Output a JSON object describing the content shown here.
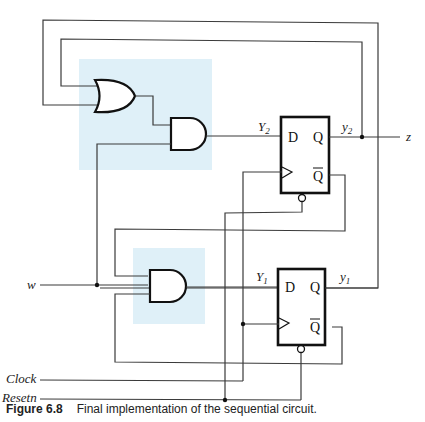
{
  "figure": {
    "type": "sequential circuit schematic (Moore FSM with two D flip-flops)",
    "caption_label": "Figure 6.8",
    "caption_text": "Final implementation of the sequential circuit."
  },
  "signals": {
    "input_w": "w",
    "clock": "Clock",
    "reset": "Resetn",
    "output_z": "z"
  },
  "flipflops": [
    {
      "id": "ff2",
      "next_state": "Y",
      "next_state_sub": "2",
      "state": "y",
      "state_sub": "2",
      "pin_d": "D",
      "pin_q": "Q",
      "pin_qbar": "Q"
    },
    {
      "id": "ff1",
      "next_state": "Y",
      "next_state_sub": "1",
      "state": "y",
      "state_sub": "1",
      "pin_d": "D",
      "pin_q": "Q",
      "pin_qbar": "Q"
    }
  ],
  "gates": [
    {
      "id": "or1",
      "type": "OR",
      "inputs": [
        "y1",
        "y2"
      ]
    },
    {
      "id": "and2",
      "type": "AND",
      "inputs": [
        "or1",
        "w"
      ],
      "output": "Y2"
    },
    {
      "id": "and1",
      "type": "AND",
      "inputs": [
        "y2bar",
        "w",
        "y1bar"
      ],
      "output": "Y1"
    }
  ],
  "colors": {
    "highlight": "#dff0f8",
    "wire": "#3a3a3a",
    "outline": "#111111"
  }
}
